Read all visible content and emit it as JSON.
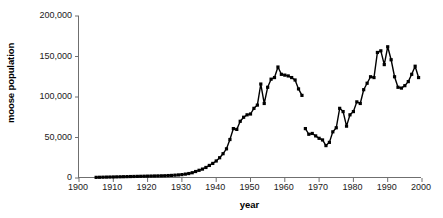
{
  "chart_data": {
    "type": "line",
    "title": "",
    "subtitle": "",
    "xlabel": "year",
    "ylabel": "moose population",
    "xlim": [
      1900,
      2000
    ],
    "ylim": [
      0,
      200000
    ],
    "grid": false,
    "legend": null,
    "marker": "square",
    "line_color": "#000000",
    "axis_color": "#6f6f6f",
    "xticks": [
      1900,
      1910,
      1920,
      1930,
      1940,
      1950,
      1960,
      1970,
      1980,
      1990,
      2000
    ],
    "xtick_labels": [
      "1900",
      "1910",
      "1920",
      "1930",
      "1940",
      "1950",
      "1960",
      "1970",
      "1980",
      "1990",
      "2000"
    ],
    "yticks": [
      0,
      50000,
      100000,
      150000,
      200000
    ],
    "ytick_labels": [
      "0",
      "50,000",
      "100,000",
      "150,000",
      "200,000"
    ],
    "series": [
      {
        "name": "moose population 1905-1965",
        "x": [
          1905,
          1906,
          1907,
          1908,
          1909,
          1910,
          1911,
          1912,
          1913,
          1914,
          1915,
          1916,
          1917,
          1918,
          1919,
          1920,
          1921,
          1922,
          1923,
          1924,
          1925,
          1926,
          1927,
          1928,
          1929,
          1930,
          1931,
          1932,
          1933,
          1934,
          1935,
          1936,
          1937,
          1938,
          1939,
          1940,
          1941,
          1942,
          1943,
          1944,
          1945,
          1946,
          1947,
          1948,
          1949,
          1950,
          1951,
          1952,
          1953,
          1954,
          1955,
          1956,
          1957,
          1958,
          1959,
          1960,
          1961,
          1962,
          1963,
          1964,
          1965
        ],
        "values": [
          800,
          900,
          1000,
          1100,
          1200,
          1300,
          1400,
          1500,
          1600,
          1700,
          1800,
          1900,
          2000,
          2100,
          2200,
          2300,
          2400,
          2500,
          2600,
          2700,
          2800,
          3000,
          3200,
          3500,
          3800,
          4200,
          4800,
          5500,
          6500,
          8000,
          9500,
          11000,
          13000,
          15500,
          18000,
          21000,
          25000,
          30000,
          36000,
          47500,
          61000,
          60000,
          70000,
          75000,
          78000,
          79000,
          86000,
          90000,
          116000,
          92000,
          112000,
          122000,
          124000,
          137000,
          128000,
          127000,
          126000,
          124000,
          121000,
          110000,
          102000
        ]
      },
      {
        "name": "moose population 1966-1999",
        "x": [
          1966,
          1967,
          1968,
          1969,
          1970,
          1971,
          1972,
          1973,
          1974,
          1975,
          1976,
          1977,
          1978,
          1979,
          1980,
          1981,
          1982,
          1983,
          1984,
          1985,
          1986,
          1987,
          1988,
          1989,
          1990,
          1991,
          1992,
          1993,
          1994,
          1995,
          1996,
          1997,
          1998,
          1999
        ],
        "values": [
          61000,
          54000,
          55000,
          52000,
          49000,
          47000,
          40000,
          44000,
          57000,
          62000,
          86000,
          82000,
          64000,
          78000,
          82000,
          94000,
          92000,
          109000,
          117000,
          125000,
          124000,
          155000,
          157000,
          140000,
          162000,
          146000,
          125000,
          112000,
          111000,
          114000,
          119000,
          128000,
          138000,
          124000
        ]
      }
    ]
  },
  "labels": {
    "x_axis_title": "year",
    "y_axis_title": "moose population"
  }
}
